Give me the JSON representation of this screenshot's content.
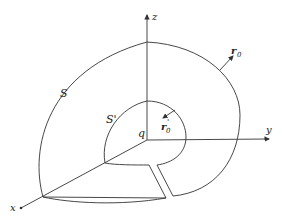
{
  "diagram": {
    "axes": {
      "x_label": "x",
      "y_label": "y",
      "z_label": "z"
    },
    "labels": {
      "outer_surface": "S",
      "inner_surface": "S'",
      "charge": "q",
      "outer_normal": "r",
      "outer_normal_sub": "0",
      "inner_normal": "r",
      "inner_normal_sub": "0",
      "inner_normal_prime": "'"
    },
    "colors": {
      "stroke": "#333333",
      "text": "#222222",
      "background": "#ffffff"
    }
  }
}
